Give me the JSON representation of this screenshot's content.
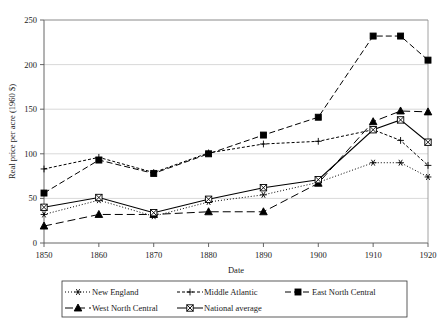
{
  "chart_data": {
    "type": "line",
    "title": "",
    "xlabel": "Date",
    "ylabel": "Real price per acre (1960 $)",
    "x": [
      1850,
      1860,
      1870,
      1880,
      1890,
      1900,
      1910,
      1915,
      1920
    ],
    "xtick_labels": [
      "1850",
      "1860",
      "1870",
      "1880",
      "1890",
      "1900",
      "1910",
      "1920"
    ],
    "xtick_values": [
      1850,
      1860,
      1870,
      1880,
      1890,
      1900,
      1910,
      1920
    ],
    "ytick_labels": [
      "0",
      "50",
      "100",
      "150",
      "200",
      "250"
    ],
    "ytick_values": [
      0,
      50,
      100,
      150,
      200,
      250
    ],
    "xlim": [
      1850,
      1920
    ],
    "ylim": [
      0,
      250
    ],
    "grid": "horizontal",
    "legend_position": "bottom",
    "series": [
      {
        "name": "New England",
        "marker": "asterisk",
        "line_style": "dotted",
        "values": [
          32,
          48,
          30,
          46,
          54,
          68,
          90,
          90,
          74
        ]
      },
      {
        "name": "Middle Atlantic",
        "marker": "plus",
        "line_style": "dashed-dot",
        "values": [
          83,
          96,
          79,
          101,
          111,
          114,
          127,
          115,
          87
        ]
      },
      {
        "name": "East North Central",
        "marker": "filled-square",
        "line_style": "dashed",
        "values": [
          56,
          93,
          78,
          100,
          121,
          141,
          232,
          232,
          205
        ]
      },
      {
        "name": "West North Central",
        "marker": "filled-triangle",
        "line_style": "long-dashed",
        "values": [
          19,
          32,
          32,
          35,
          35,
          67,
          136,
          148,
          147
        ]
      },
      {
        "name": "National average",
        "marker": "open-square",
        "line_style": "solid",
        "values": [
          40,
          51,
          34,
          49,
          62,
          71,
          127,
          138,
          113
        ]
      }
    ]
  },
  "legend": {
    "entries": [
      {
        "label": "New England"
      },
      {
        "label": "Middle Atlantic"
      },
      {
        "label": "East North Central"
      },
      {
        "label": "West North Central"
      },
      {
        "label": "National average"
      }
    ]
  },
  "colors": {
    "ink": "#000000",
    "grid": "#c9c9c9",
    "axis": "#555555",
    "background": "#ffffff"
  }
}
